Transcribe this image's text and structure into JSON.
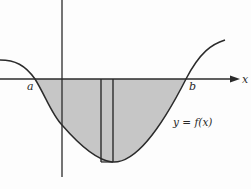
{
  "diagram": {
    "axis_labels": {
      "x": "x"
    },
    "point_labels": {
      "a": "a",
      "b": "b"
    },
    "curve_label": "y = f(x)",
    "colors": {
      "shading": "#c6c6c6",
      "line": "#2b2b2b",
      "background": "#fdfdfd"
    }
  }
}
